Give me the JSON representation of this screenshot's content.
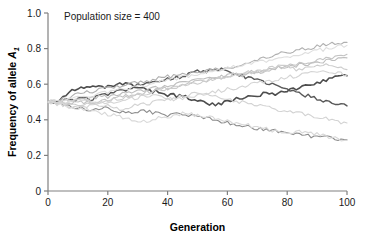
{
  "chart_data": {
    "type": "line",
    "title": "",
    "annotation": "Population size = 400",
    "xlabel": "Generation",
    "ylabel": "Frequency of allele A",
    "ylabel_sub": "1",
    "xlim": [
      0,
      100
    ],
    "ylim": [
      0,
      1.0
    ],
    "xticks": [
      0,
      20,
      40,
      60,
      80,
      100
    ],
    "xtick_labels": [
      "0",
      "20",
      "40",
      "60",
      "80",
      "100"
    ],
    "yticks": [
      0,
      0.2,
      0.4,
      0.6,
      0.8,
      1.0
    ],
    "ytick_labels": [
      "0",
      "0.2",
      "0.4",
      "0.6",
      "0.8",
      "1.0"
    ],
    "grid": false,
    "legend": "none",
    "x_step": 2,
    "series": [
      {
        "name": "replicate-1-highlight",
        "color": "#4d4d4d",
        "width": 1.6,
        "values": [
          0.5,
          0.505,
          0.515,
          0.545,
          0.565,
          0.575,
          0.572,
          0.585,
          0.578,
          0.585,
          0.582,
          0.592,
          0.598,
          0.602,
          0.592,
          0.582,
          0.572,
          0.565,
          0.558,
          0.548,
          0.542,
          0.538,
          0.532,
          0.528,
          0.518,
          0.508,
          0.498,
          0.492,
          0.488,
          0.492,
          0.502,
          0.512,
          0.518,
          0.522,
          0.528,
          0.535,
          0.545,
          0.552,
          0.548,
          0.555,
          0.562,
          0.572,
          0.578,
          0.588,
          0.598,
          0.608,
          0.618,
          0.632,
          0.642,
          0.652,
          0.648
        ]
      },
      {
        "name": "replicate-2-highlight",
        "color": "#595959",
        "width": 1.4,
        "values": [
          0.5,
          0.498,
          0.505,
          0.512,
          0.508,
          0.515,
          0.522,
          0.518,
          0.525,
          0.535,
          0.542,
          0.552,
          0.562,
          0.572,
          0.582,
          0.592,
          0.602,
          0.612,
          0.608,
          0.618,
          0.628,
          0.635,
          0.642,
          0.652,
          0.662,
          0.672,
          0.668,
          0.678,
          0.688,
          0.682,
          0.672,
          0.662,
          0.652,
          0.642,
          0.632,
          0.622,
          0.612,
          0.602,
          0.592,
          0.578,
          0.568,
          0.558,
          0.548,
          0.538,
          0.528,
          0.518,
          0.508,
          0.498,
          0.492,
          0.485,
          0.478
        ]
      },
      {
        "name": "replicate-3",
        "color": "#8c8c8c",
        "width": 1.1,
        "values": [
          0.5,
          0.495,
          0.49,
          0.482,
          0.475,
          0.468,
          0.462,
          0.455,
          0.462,
          0.468,
          0.462,
          0.455,
          0.448,
          0.442,
          0.438,
          0.445,
          0.452,
          0.445,
          0.438,
          0.432,
          0.425,
          0.432,
          0.438,
          0.432,
          0.425,
          0.418,
          0.412,
          0.405,
          0.398,
          0.392,
          0.385,
          0.378,
          0.372,
          0.365,
          0.358,
          0.352,
          0.348,
          0.342,
          0.338,
          0.332,
          0.328,
          0.322,
          0.318,
          0.312,
          0.308,
          0.305,
          0.302,
          0.298,
          0.295,
          0.292,
          0.288
        ]
      },
      {
        "name": "replicate-4",
        "color": "#b0b0b0",
        "width": 1.1,
        "values": [
          0.5,
          0.508,
          0.515,
          0.522,
          0.532,
          0.542,
          0.552,
          0.558,
          0.565,
          0.572,
          0.578,
          0.585,
          0.592,
          0.598,
          0.605,
          0.612,
          0.618,
          0.622,
          0.628,
          0.635,
          0.642,
          0.648,
          0.652,
          0.658,
          0.662,
          0.668,
          0.672,
          0.678,
          0.682,
          0.688,
          0.692,
          0.698,
          0.702,
          0.712,
          0.722,
          0.732,
          0.742,
          0.752,
          0.762,
          0.772,
          0.778,
          0.785,
          0.792,
          0.798,
          0.805,
          0.812,
          0.818,
          0.822,
          0.828,
          0.832,
          0.835
        ]
      },
      {
        "name": "replicate-5",
        "color": "#bdbdbd",
        "width": 1.1,
        "values": [
          0.5,
          0.492,
          0.485,
          0.492,
          0.498,
          0.505,
          0.512,
          0.518,
          0.525,
          0.532,
          0.528,
          0.535,
          0.542,
          0.548,
          0.555,
          0.562,
          0.568,
          0.575,
          0.582,
          0.588,
          0.595,
          0.602,
          0.608,
          0.612,
          0.618,
          0.622,
          0.628,
          0.632,
          0.638,
          0.642,
          0.648,
          0.652,
          0.658,
          0.662,
          0.668,
          0.672,
          0.678,
          0.682,
          0.688,
          0.692,
          0.698,
          0.702,
          0.708,
          0.712,
          0.718,
          0.722,
          0.728,
          0.732,
          0.738,
          0.742,
          0.748
        ]
      },
      {
        "name": "replicate-6",
        "color": "#c4c4c4",
        "width": 1.1,
        "values": [
          0.5,
          0.505,
          0.498,
          0.505,
          0.512,
          0.505,
          0.498,
          0.492,
          0.498,
          0.505,
          0.512,
          0.518,
          0.525,
          0.532,
          0.538,
          0.545,
          0.552,
          0.558,
          0.565,
          0.572,
          0.578,
          0.585,
          0.592,
          0.598,
          0.605,
          0.612,
          0.618,
          0.625,
          0.632,
          0.638,
          0.645,
          0.652,
          0.648,
          0.655,
          0.662,
          0.668,
          0.675,
          0.682,
          0.688,
          0.695,
          0.702,
          0.708,
          0.715,
          0.722,
          0.728,
          0.735,
          0.742,
          0.748,
          0.755,
          0.762,
          0.768
        ]
      },
      {
        "name": "replicate-7",
        "color": "#cccccc",
        "width": 1.1,
        "values": [
          0.5,
          0.502,
          0.508,
          0.502,
          0.495,
          0.488,
          0.482,
          0.488,
          0.495,
          0.502,
          0.508,
          0.515,
          0.522,
          0.528,
          0.535,
          0.542,
          0.548,
          0.555,
          0.562,
          0.568,
          0.575,
          0.582,
          0.588,
          0.595,
          0.602,
          0.608,
          0.615,
          0.622,
          0.628,
          0.635,
          0.642,
          0.648,
          0.655,
          0.662,
          0.668,
          0.675,
          0.682,
          0.688,
          0.695,
          0.702,
          0.695,
          0.688,
          0.682,
          0.688,
          0.695,
          0.702,
          0.708,
          0.702,
          0.695,
          0.688,
          0.682
        ]
      },
      {
        "name": "replicate-8",
        "color": "#d2d2d2",
        "width": 1.1,
        "values": [
          0.5,
          0.495,
          0.488,
          0.482,
          0.475,
          0.468,
          0.475,
          0.482,
          0.488,
          0.482,
          0.475,
          0.468,
          0.462,
          0.468,
          0.475,
          0.482,
          0.488,
          0.495,
          0.502,
          0.508,
          0.515,
          0.522,
          0.528,
          0.535,
          0.542,
          0.548,
          0.542,
          0.535,
          0.528,
          0.522,
          0.515,
          0.508,
          0.502,
          0.495,
          0.488,
          0.482,
          0.475,
          0.468,
          0.462,
          0.455,
          0.448,
          0.442,
          0.435,
          0.428,
          0.422,
          0.415,
          0.408,
          0.402,
          0.395,
          0.388,
          0.382
        ]
      },
      {
        "name": "replicate-9",
        "color": "#d8d8d8",
        "width": 1.1,
        "values": [
          0.5,
          0.492,
          0.485,
          0.478,
          0.472,
          0.465,
          0.458,
          0.452,
          0.445,
          0.438,
          0.432,
          0.425,
          0.418,
          0.412,
          0.405,
          0.398,
          0.392,
          0.398,
          0.405,
          0.412,
          0.418,
          0.425,
          0.432,
          0.438,
          0.432,
          0.425,
          0.418,
          0.412,
          0.405,
          0.398,
          0.392,
          0.385,
          0.378,
          0.372,
          0.365,
          0.358,
          0.352,
          0.345,
          0.338,
          0.332,
          0.325,
          0.332,
          0.338,
          0.332,
          0.325,
          0.318,
          0.312,
          0.305,
          0.298,
          0.292,
          0.285
        ]
      },
      {
        "name": "replicate-10",
        "color": "#dedede",
        "width": 1.1,
        "values": [
          0.5,
          0.508,
          0.515,
          0.508,
          0.515,
          0.522,
          0.528,
          0.535,
          0.542,
          0.548,
          0.555,
          0.562,
          0.568,
          0.575,
          0.582,
          0.588,
          0.595,
          0.602,
          0.608,
          0.615,
          0.622,
          0.628,
          0.635,
          0.642,
          0.648,
          0.655,
          0.662,
          0.668,
          0.675,
          0.682,
          0.688,
          0.695,
          0.702,
          0.708,
          0.715,
          0.722,
          0.728,
          0.735,
          0.742,
          0.748,
          0.755,
          0.762,
          0.768,
          0.775,
          0.782,
          0.788,
          0.795,
          0.802,
          0.808,
          0.812,
          0.818
        ]
      },
      {
        "name": "replicate-11",
        "color": "#d4d4d4",
        "width": 1.1,
        "values": [
          0.5,
          0.498,
          0.492,
          0.498,
          0.505,
          0.512,
          0.518,
          0.512,
          0.505,
          0.498,
          0.492,
          0.498,
          0.505,
          0.512,
          0.518,
          0.525,
          0.532,
          0.538,
          0.532,
          0.525,
          0.518,
          0.512,
          0.518,
          0.525,
          0.532,
          0.538,
          0.545,
          0.552,
          0.558,
          0.565,
          0.572,
          0.578,
          0.585,
          0.592,
          0.598,
          0.605,
          0.612,
          0.618,
          0.625,
          0.632,
          0.638,
          0.645,
          0.652,
          0.658,
          0.665,
          0.672,
          0.678,
          0.672,
          0.665,
          0.658,
          0.652
        ]
      }
    ]
  },
  "axes": {
    "tick_color": "#808080",
    "text_color": "#1a1a1a"
  }
}
